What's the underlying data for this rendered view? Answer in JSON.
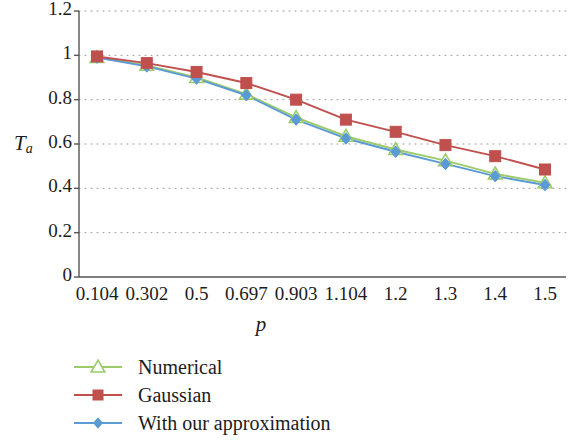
{
  "chart_data": {
    "type": "line",
    "title": "",
    "xlabel": "p",
    "ylabel": "T_a",
    "ylabel_base": "T",
    "ylabel_sub": "a",
    "categories": [
      "0.104",
      "0.302",
      "0.5",
      "0.697",
      "0.903",
      "1.104",
      "1.2",
      "1.3",
      "1.4",
      "1.5"
    ],
    "ylim": [
      0,
      1.2
    ],
    "yticks": [
      "1.2",
      "1",
      "0.8",
      "0.6",
      "0.4",
      "0.2",
      "0"
    ],
    "ytick_values": [
      1.2,
      1,
      0.8,
      0.6,
      0.4,
      0.2,
      0
    ],
    "grid": "horizontal-dotted",
    "legend_position": "below-left",
    "series": [
      {
        "name": "Numerical",
        "color": "#9ccb6a",
        "marker": "triangle-open",
        "values": [
          0.99,
          0.955,
          0.9,
          0.825,
          0.72,
          0.635,
          0.575,
          0.525,
          0.465,
          0.425
        ]
      },
      {
        "name": "Gaussian",
        "color": "#c0504d",
        "marker": "square-filled",
        "values": [
          0.995,
          0.965,
          0.925,
          0.875,
          0.8,
          0.71,
          0.655,
          0.595,
          0.545,
          0.485
        ]
      },
      {
        "name": "With our approximation",
        "color": "#5b9bd5",
        "marker": "diamond-filled",
        "values": [
          0.99,
          0.95,
          0.895,
          0.82,
          0.71,
          0.625,
          0.565,
          0.51,
          0.455,
          0.415
        ]
      }
    ]
  },
  "legend": {
    "items": [
      {
        "label": "Numerical"
      },
      {
        "label": "Gaussian"
      },
      {
        "label": "With our approximation"
      }
    ]
  }
}
